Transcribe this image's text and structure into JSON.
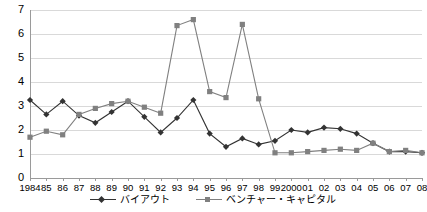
{
  "chart_data": {
    "type": "line",
    "title": "",
    "subtitle": "",
    "xlabel": "",
    "ylabel": "",
    "grid": true,
    "legend_position": "bottom-center",
    "ylim": [
      0,
      7
    ],
    "yticks": [
      0,
      1,
      2,
      3,
      4,
      5,
      6,
      7
    ],
    "ytick_labels": [
      "0",
      "1",
      "2",
      "3",
      "4",
      "5",
      "6",
      "7"
    ],
    "categories": [
      "1984",
      "85",
      "86",
      "87",
      "88",
      "89",
      "90",
      "91",
      "92",
      "93",
      "94",
      "95",
      "96",
      "97",
      "98",
      "99",
      "2000",
      "01",
      "02",
      "03",
      "04",
      "05",
      "06",
      "07",
      "08"
    ],
    "series": [
      {
        "name": "バイアウト",
        "marker": "diamond",
        "color": "#333333",
        "values": [
          3.25,
          2.65,
          3.2,
          2.6,
          2.3,
          2.75,
          3.2,
          2.55,
          1.9,
          2.5,
          3.25,
          1.85,
          1.3,
          1.65,
          1.4,
          1.55,
          2.0,
          1.9,
          2.1,
          2.05,
          1.85,
          1.45,
          1.1,
          1.1,
          1.05
        ],
        "annotations": []
      },
      {
        "name": "ベンチャー・キャピタル",
        "marker": "square",
        "color": "#808080",
        "values": [
          1.7,
          1.95,
          1.8,
          2.65,
          2.9,
          3.1,
          3.2,
          2.95,
          2.7,
          6.35,
          6.6,
          3.6,
          3.35,
          6.4,
          3.3,
          1.05,
          1.05,
          1.1,
          1.15,
          1.2,
          1.15,
          1.45,
          1.1,
          1.15,
          1.05
        ],
        "annotations": []
      }
    ]
  },
  "legend": {
    "items": [
      {
        "label": "バイアウト",
        "marker": "diamond",
        "color": "#333333"
      },
      {
        "label": "ベンチャー・キャピタル",
        "marker": "square",
        "color": "#808080"
      }
    ]
  },
  "colors": {
    "background": "#ffffff",
    "gridline": "#d9d9d9",
    "axis": "#9a9a9a",
    "buyout": "#333333",
    "venture": "#808080",
    "text": "#000000"
  }
}
